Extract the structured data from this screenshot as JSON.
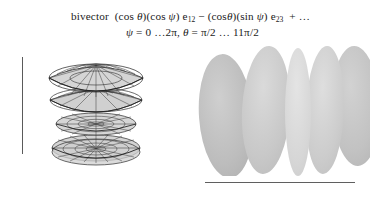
{
  "figure": {
    "caption": {
      "line1": {
        "prefix": "bivector",
        "term1_open": "(cos ",
        "term1_theta": "θ",
        "term1_mid": ")(cos ",
        "term1_psi": "ψ",
        "term1_close": ") e",
        "term1_sub": "12",
        "operator": "−",
        "term2_open": "(cos",
        "term2_theta": "θ",
        "term2_mid": ")(sin ",
        "term2_psi": "ψ",
        "term2_close": ") e",
        "term2_sub": "23",
        "tail": "+ …",
        "plain": "bivector (cos θ)(cos ψ) e12 − (cosθ)(sin ψ) e23 + …"
      },
      "line2": {
        "psi_symbol": "ψ",
        "psi_range": " = 0 …2π,",
        "theta_symbol": "θ",
        "theta_range": " = π/2 … 11π/2",
        "plain": "ψ = 0 …2π, θ = π/2 … 11π/2"
      }
    },
    "left_panel": {
      "name": "wireframe-stack",
      "description": "stack of four nested lens/bowl wireframe surfaces of revolution",
      "surface_count": 4,
      "mesh_color": "#2e2e2e",
      "fill_color": "#d2d2d2",
      "axis_bar": {
        "label": "vertical-scale-bar",
        "color": "#5a5a5a"
      }
    },
    "right_panel": {
      "name": "lobe-stack",
      "description": "five overlapping shaded vertical ellipsoid lobes",
      "lobe_count": 5,
      "lobes": [
        {
          "id": "lobe-1",
          "cx": 36,
          "cy": 72,
          "rx": 27,
          "ry": 62,
          "rotate": -4,
          "fill": "#bcbcbc"
        },
        {
          "id": "lobe-2",
          "cx": 76,
          "cy": 66,
          "rx": 24,
          "ry": 64,
          "rotate": 3,
          "fill": "#c9c9c9"
        },
        {
          "id": "lobe-3",
          "cx": 108,
          "cy": 68,
          "rx": 13,
          "ry": 64,
          "rotate": 0,
          "fill": "#d8d8d8"
        },
        {
          "id": "lobe-4",
          "cx": 135,
          "cy": 66,
          "rx": 19,
          "ry": 64,
          "rotate": 2,
          "fill": "#cdcdcd"
        },
        {
          "id": "lobe-5",
          "cx": 166,
          "cy": 62,
          "rx": 24,
          "ry": 60,
          "rotate": -2,
          "fill": "#c4c4c4"
        }
      ],
      "baseline": {
        "label": "horizontal-scale-bar",
        "color": "#5f5f5f"
      }
    },
    "colors": {
      "background": "#ffffff",
      "text": "#1b1b1b",
      "rule": "#5a5a5a",
      "mesh": "#2e2e2e",
      "lobe_light": "#d8d8d8",
      "lobe_dark": "#bcbcbc"
    }
  }
}
